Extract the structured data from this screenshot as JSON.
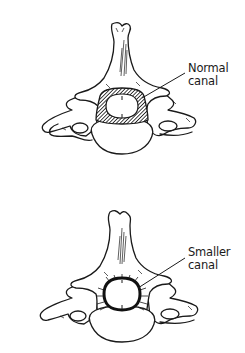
{
  "figure": {
    "panels": [
      {
        "id": "normal",
        "label_line1": "Normal",
        "label_line2": "canal",
        "canal_state": "normal"
      },
      {
        "id": "smaller",
        "label_line1": "Smaller",
        "label_line2": "canal",
        "canal_state": "narrowed"
      }
    ],
    "colors": {
      "line": "#1a1a1a",
      "background": "#ffffff",
      "hatch": "#333333"
    }
  }
}
